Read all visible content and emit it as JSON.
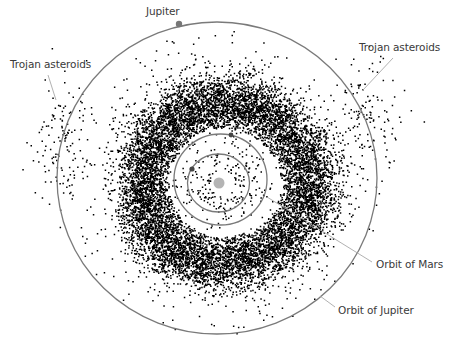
{
  "diagram": {
    "labels": {
      "jupiter": "Jupiter",
      "trojan_left": "Trojan asteroids",
      "trojan_right": "Trojan asteroids",
      "orbit_mars": "Orbit of Mars",
      "orbit_jupiter": "Orbit of Jupiter"
    },
    "colors": {
      "background": "#ffffff",
      "orbit": "#7a7a7a",
      "leader": "#a8a8a8",
      "asteroid": "#000000",
      "sun": "#b4b4b4",
      "planet": "#555555",
      "text": "#3a3a3a"
    },
    "sun": {
      "cx": 219,
      "cy": 183,
      "r": 5.5
    },
    "orbits": {
      "earth": {
        "cx": 218.5,
        "cy": 183,
        "rx": 31,
        "ry": 29
      },
      "mars": {
        "cx": 220.5,
        "cy": 179.5,
        "rx": 46.5,
        "ry": 45.5
      },
      "jupiter": {
        "cx": 217,
        "cy": 178,
        "rx": 160,
        "ry": 156
      }
    },
    "planets": {
      "earth": {
        "cx": 192,
        "cy": 169,
        "r": 2.6
      },
      "mars": {
        "cx": 231,
        "cy": 135,
        "r": 2.4
      },
      "jupiter": {
        "cx": 179,
        "cy": 24,
        "r": 3.2
      }
    },
    "belt": {
      "cx": 222,
      "cy": 182,
      "inner_r": 62,
      "outer_r": 112,
      "peak_r": 84,
      "sigma": 16,
      "count": 15000,
      "scatter_count": 260,
      "dot_size": 1.5
    },
    "trojans": {
      "left": {
        "cx": 62,
        "cy": 140,
        "spread_x": 22,
        "spread_y": 55,
        "count": 130
      },
      "right": {
        "cx": 368,
        "cy": 112,
        "spread_x": 26,
        "spread_y": 45,
        "count": 120
      }
    },
    "leaders": {
      "trojan_left": [
        48,
        75,
        56,
        100
      ],
      "trojan_right": [
        393,
        58,
        363,
        90
      ],
      "orbit_mars": [
        267,
        197,
        372,
        262
      ],
      "orbit_jupiter": [
        320,
        296,
        335,
        307
      ]
    }
  }
}
